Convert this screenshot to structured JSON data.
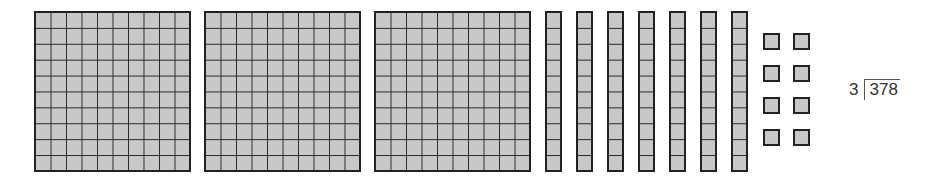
{
  "diagram": {
    "hundreds": {
      "count": 3,
      "grid": "10x10"
    },
    "tens": {
      "count": 7,
      "cells": 10
    },
    "ones": {
      "count": 8
    },
    "problem": {
      "divisor": "3",
      "dividend": "378"
    },
    "colors": {
      "fill": "#c8c8c8",
      "stroke": "#222222"
    }
  }
}
